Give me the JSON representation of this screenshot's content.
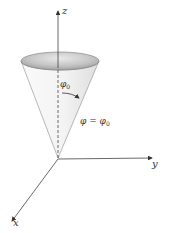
{
  "figure": {
    "axes": {
      "z_label": "z",
      "y_label": "y",
      "x_label": "x"
    },
    "angle_label": {
      "symbol": "φ",
      "subscript": "0"
    },
    "equation": {
      "lhs": "φ",
      "op": "=",
      "rhs_symbol": "φ",
      "rhs_subscript": "0"
    },
    "colors": {
      "axis": "#444444",
      "cone_edge": "#777777",
      "cone_fill": "#f2f2f2",
      "rim_inner": "#b5b5b5",
      "text": "#333333"
    }
  }
}
